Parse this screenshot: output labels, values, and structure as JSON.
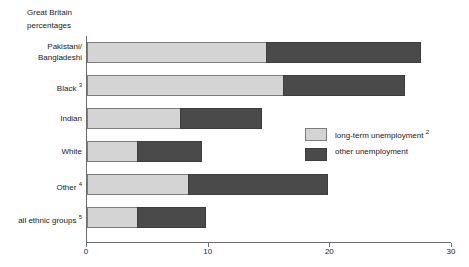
{
  "header": {
    "line1": "Great Britain",
    "line2": "percentages"
  },
  "legend": {
    "items": [
      {
        "label": "long-term unemployment",
        "note": "2",
        "color": "#d4d4d4",
        "name": "long-term-unemployment"
      },
      {
        "label": "other unemployment",
        "note": "",
        "color": "#4a4a4a",
        "name": "other-unemployment"
      }
    ]
  },
  "axis": {
    "ticks": [
      "0",
      "10",
      "20",
      "30"
    ],
    "tick_values": [
      0,
      10,
      20,
      30
    ]
  },
  "chart_data": {
    "type": "bar",
    "orientation": "horizontal",
    "stacked": true,
    "title": "",
    "subtitle": "Great Britain percentages",
    "xlabel": "",
    "ylabel": "",
    "xlim": [
      0,
      30
    ],
    "grid": false,
    "legend_position": "right-middle",
    "categories": [
      "Pakistani/ Bangladeshi",
      "Black",
      "Indian",
      "White",
      "Other",
      "all ethnic groups"
    ],
    "category_notes": [
      "",
      "3",
      "",
      "",
      "4",
      "5"
    ],
    "series": [
      {
        "name": "long-term unemployment",
        "color": "#d4d4d4",
        "values": [
          14.8,
          16.2,
          7.7,
          4.2,
          8.4,
          4.2
        ]
      },
      {
        "name": "other unemployment",
        "color": "#4a4a4a",
        "values": [
          12.7,
          10.0,
          6.8,
          5.3,
          11.5,
          5.7
        ]
      }
    ],
    "totals": [
      27.5,
      26.2,
      14.5,
      9.5,
      19.9,
      9.9
    ]
  }
}
